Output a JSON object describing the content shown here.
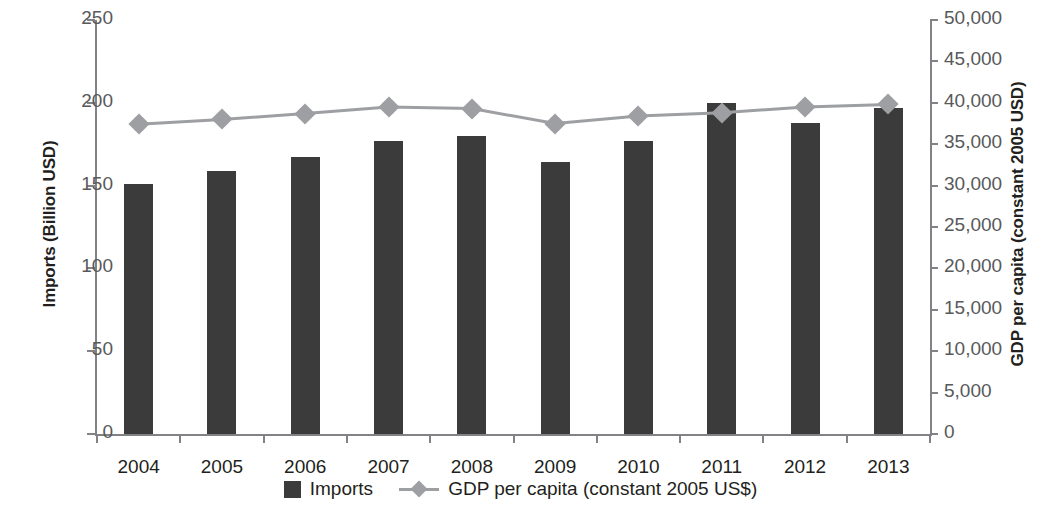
{
  "chart_data": {
    "type": "bar",
    "title": "",
    "subtitle": "",
    "categories": [
      "2004",
      "2005",
      "2006",
      "2007",
      "2008",
      "2009",
      "2010",
      "2011",
      "2012",
      "2013"
    ],
    "xlabel": "",
    "grid": false,
    "legend_position": "bottom",
    "series": [
      {
        "name": "Imports",
        "type": "bar",
        "axis": "left",
        "color": "#3b3b3b",
        "values": [
          151,
          159,
          167,
          177,
          180,
          164,
          177,
          200,
          188,
          197
        ]
      },
      {
        "name": "GDP per capita (constant 2005 US$)",
        "type": "line",
        "axis": "right",
        "color": "#9d9fa2",
        "marker": "diamond",
        "values": [
          37400,
          38000,
          38700,
          39500,
          39300,
          37500,
          38400,
          38800,
          39500,
          39800
        ]
      }
    ],
    "axes": {
      "left": {
        "label": "Imports (Billion USD)",
        "min": 0,
        "max": 250,
        "ticks": [
          0,
          50,
          100,
          150,
          200,
          250
        ],
        "tick_labels": [
          "0",
          "50",
          "100",
          "150",
          "200",
          "250"
        ]
      },
      "right": {
        "label": "GDP per capita (constant 2005 USD)",
        "min": 0,
        "max": 50000,
        "ticks": [
          0,
          5000,
          10000,
          15000,
          20000,
          25000,
          30000,
          35000,
          40000,
          45000,
          50000
        ],
        "tick_labels": [
          "0",
          "5,000",
          "10,000",
          "15,000",
          "20,000",
          "25,000",
          "30,000",
          "35,000",
          "40,000",
          "45,000",
          "50,000"
        ]
      }
    },
    "legend": [
      {
        "label": "Imports",
        "swatch": "bar",
        "color": "#3b3b3b"
      },
      {
        "label": "GDP per capita (constant 2005 US$)",
        "swatch": "line-marker",
        "color": "#9d9fa2"
      }
    ]
  }
}
